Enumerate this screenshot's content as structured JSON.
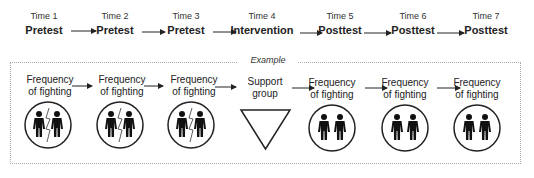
{
  "timeline": [
    {
      "time": "Time 1",
      "phase": "Pretest"
    },
    {
      "time": "Time 2",
      "phase": "Pretest"
    },
    {
      "time": "Time 3",
      "phase": "Pretest"
    },
    {
      "time": "Time 4",
      "phase": "Intervention"
    },
    {
      "time": "Time 5",
      "phase": "Posttest"
    },
    {
      "time": "Time 6",
      "phase": "Posttest"
    },
    {
      "time": "Time 7",
      "phase": "Posttest"
    }
  ],
  "example": {
    "label": "Example",
    "nodes": [
      {
        "line1": "Frequency",
        "line2": "of fighting",
        "icon": "two-people-fighting-icon"
      },
      {
        "line1": "Frequency",
        "line2": "of fighting",
        "icon": "two-people-fighting-icon"
      },
      {
        "line1": "Frequency",
        "line2": "of fighting",
        "icon": "two-people-fighting-icon"
      },
      {
        "line1": "Support",
        "line2": "group",
        "icon": "inverted-triangle-icon"
      },
      {
        "line1": "Frequency",
        "line2": "of fighting",
        "icon": "two-people-icon"
      },
      {
        "line1": "Frequency",
        "line2": "of fighting",
        "icon": "two-people-icon"
      },
      {
        "line1": "Frequency",
        "line2": "of fighting",
        "icon": "two-people-icon"
      }
    ]
  },
  "colors": {
    "stroke": "#222222",
    "border": "#aaaaaa"
  }
}
